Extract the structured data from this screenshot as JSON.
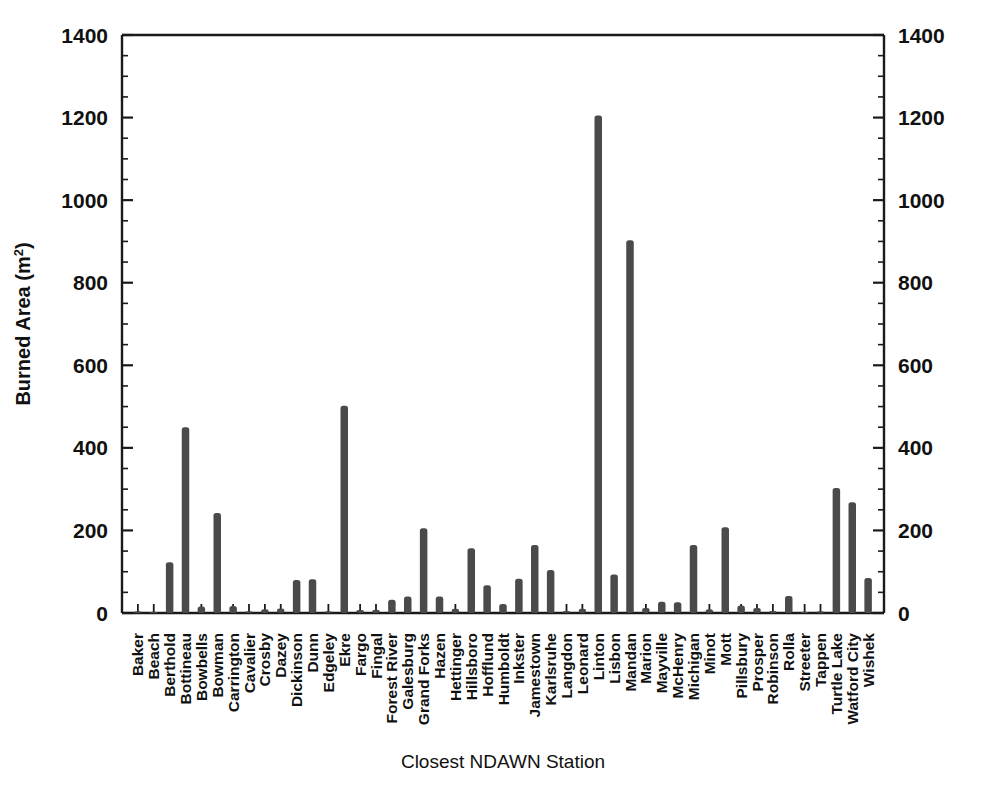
{
  "chart_data": {
    "type": "bar",
    "title": "",
    "xlabel": "Closest NDAWN Station",
    "ylabel": "Burned Area (m2)",
    "ylabel_base": "Burned Area (m",
    "ylabel_sup": "2",
    "ylabel_tail": ")",
    "ylim": [
      0,
      1400
    ],
    "ytick_step": 200,
    "yminor_step": 50,
    "grid": false,
    "legend": "none",
    "right_axis_mirrored": true,
    "ytick_labels": [
      "0",
      "200",
      "400",
      "600",
      "800",
      "1000",
      "1200",
      "1400"
    ],
    "ytick_values": [
      0,
      200,
      400,
      600,
      800,
      1000,
      1200,
      1400
    ],
    "categories": [
      "Baker",
      "Beach",
      "Berthold",
      "Bottineau",
      "Bowbells",
      "Bowman",
      "Carrington",
      "Cavalier",
      "Crosby",
      "Dazey",
      "Dickinson",
      "Dunn",
      "Edgeley",
      "Ekre",
      "Fargo",
      "Fingal",
      "Forest River",
      "Galesburg",
      "Grand Forks",
      "Hazen",
      "Hettinger",
      "Hillsboro",
      "Hofflund",
      "Humboldt",
      "Inkster",
      "Jamestown",
      "Karlsruhe",
      "Langdon",
      "Leonard",
      "Linton",
      "Lisbon",
      "Mandan",
      "Marion",
      "Mayville",
      "McHenry",
      "Michigan",
      "Minot",
      "Mott",
      "Pillsbury",
      "Prosper",
      "Robinson",
      "Rolla",
      "Streeter",
      "Tappen",
      "Turtle Lake",
      "Watford City",
      "Wishek"
    ],
    "values": [
      4,
      2,
      123,
      450,
      16,
      242,
      17,
      4,
      9,
      11,
      80,
      82,
      4,
      502,
      7,
      8,
      32,
      40,
      205,
      40,
      10,
      157,
      67,
      22,
      83,
      165,
      104,
      5,
      10,
      1205,
      93,
      903,
      12,
      27,
      26,
      165,
      9,
      208,
      18,
      12,
      5,
      41,
      3,
      4,
      303,
      268,
      85
    ],
    "series_name": "Burned Area",
    "bar_color": "#4a4a4a",
    "axis_color": "#1a1a1a",
    "background": "#ffffff"
  }
}
